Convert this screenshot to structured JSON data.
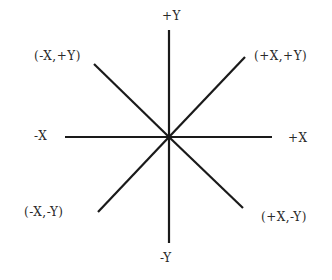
{
  "diagram": {
    "title": "",
    "center": {
      "x": 169,
      "y": 137
    },
    "line_color": "#1a1a1a",
    "labels": {
      "pos_y": "+Y",
      "neg_y": "-Y",
      "pos_x": "+X",
      "neg_x": "-X",
      "q_neg_x_pos_y": "(-X,+Y)",
      "q_pos_x_pos_y": "(+X,+Y)",
      "q_neg_x_neg_y": "(-X,-Y)",
      "q_pos_x_neg_y": "(+X,-Y)"
    },
    "lines": [
      {
        "name": "vertical-axis",
        "x1": 169,
        "y1": 30,
        "x2": 169,
        "y2": 243
      },
      {
        "name": "horizontal-axis",
        "x1": 65,
        "y1": 137,
        "x2": 272,
        "y2": 137
      },
      {
        "name": "diagonal-upper-left",
        "x1": 94,
        "y1": 64,
        "x2": 169,
        "y2": 137
      },
      {
        "name": "diagonal-upper-right",
        "x1": 245,
        "y1": 57,
        "x2": 169,
        "y2": 137
      },
      {
        "name": "diagonal-lower-left",
        "x1": 98,
        "y1": 212,
        "x2": 169,
        "y2": 137
      },
      {
        "name": "diagonal-lower-right",
        "x1": 243,
        "y1": 208,
        "x2": 169,
        "y2": 137
      }
    ]
  }
}
